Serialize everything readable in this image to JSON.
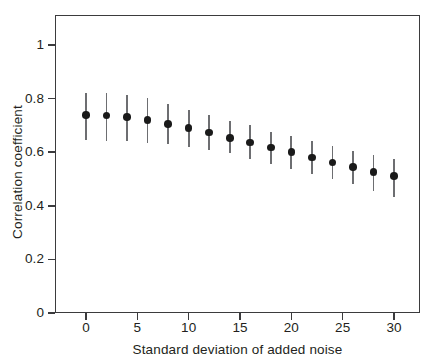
{
  "chart_data": {
    "type": "scatter",
    "title": "",
    "xlabel": "Standard deviation of added noise",
    "ylabel": "Correlation coefficient",
    "xlim": [
      -2.5,
      33
    ],
    "ylim": [
      0,
      1.1
    ],
    "grid": false,
    "legend": null,
    "xticks": [
      "0",
      "5",
      "10",
      "15",
      "20",
      "25",
      "30"
    ],
    "xtick_values": [
      0,
      5,
      10,
      15,
      20,
      25,
      30
    ],
    "yticks": [
      "0",
      "0.2",
      "0.4",
      "0.6",
      "0.8",
      "1"
    ],
    "ytick_values": [
      0,
      0.2,
      0.4,
      0.6,
      0.8,
      1
    ],
    "marker_color": "#1a1a1a",
    "errorbar_color": "#6d6e71",
    "axis_color": "#3b3b3d",
    "x": [
      0,
      2,
      4,
      6,
      8,
      10,
      12,
      14,
      16,
      18,
      20,
      22,
      24,
      26,
      28,
      30
    ],
    "values": [
      0.739,
      0.737,
      0.731,
      0.72,
      0.706,
      0.691,
      0.673,
      0.654,
      0.636,
      0.617,
      0.6,
      0.58,
      0.561,
      0.544,
      0.527,
      0.511
    ],
    "yerr_low": [
      0.645,
      0.642,
      0.641,
      0.633,
      0.629,
      0.618,
      0.607,
      0.598,
      0.576,
      0.556,
      0.539,
      0.52,
      0.5,
      0.481,
      0.456,
      0.434
    ],
    "yerr_high": [
      0.822,
      0.82,
      0.815,
      0.801,
      0.781,
      0.757,
      0.739,
      0.717,
      0.7,
      0.677,
      0.66,
      0.641,
      0.622,
      0.605,
      0.588,
      0.573
    ]
  }
}
